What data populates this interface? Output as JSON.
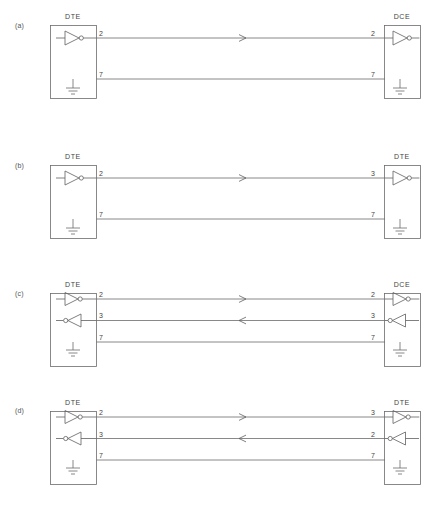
{
  "figure": {
    "line_color": "#6b6b6b",
    "text_color": "#444444",
    "background": "#ffffff"
  },
  "panels": [
    {
      "tag": "(a)",
      "left_box": {
        "label": "DTE",
        "pins": [
          "2",
          "7"
        ]
      },
      "right_box": {
        "label": "DCE",
        "pins": [
          "2",
          "7"
        ]
      },
      "links": [
        {
          "from_pin": "2",
          "to_pin": "2",
          "direction": "right",
          "kind": "data"
        },
        {
          "from_pin": "7",
          "to_pin": "7",
          "direction": "none",
          "kind": "ground"
        }
      ],
      "gates": {
        "left": [
          {
            "pin": "2",
            "role": "driver",
            "points": "right"
          }
        ],
        "right": [
          {
            "pin": "2",
            "role": "receiver",
            "points": "right"
          }
        ]
      }
    },
    {
      "tag": "(b)",
      "left_box": {
        "label": "DTE",
        "pins": [
          "2",
          "7"
        ]
      },
      "right_box": {
        "label": "DTE",
        "pins": [
          "3",
          "7"
        ]
      },
      "links": [
        {
          "from_pin": "2",
          "to_pin": "3",
          "direction": "right",
          "kind": "data"
        },
        {
          "from_pin": "7",
          "to_pin": "7",
          "direction": "none",
          "kind": "ground"
        }
      ],
      "gates": {
        "left": [
          {
            "pin": "2",
            "role": "driver",
            "points": "right"
          }
        ],
        "right": [
          {
            "pin": "3",
            "role": "receiver",
            "points": "right"
          }
        ]
      }
    },
    {
      "tag": "(c)",
      "left_box": {
        "label": "DTE",
        "pins": [
          "2",
          "3",
          "7"
        ]
      },
      "right_box": {
        "label": "DCE",
        "pins": [
          "2",
          "3",
          "7"
        ]
      },
      "links": [
        {
          "from_pin": "2",
          "to_pin": "2",
          "direction": "right",
          "kind": "data"
        },
        {
          "from_pin": "3",
          "to_pin": "3",
          "direction": "left",
          "kind": "data"
        },
        {
          "from_pin": "7",
          "to_pin": "7",
          "direction": "none",
          "kind": "ground"
        }
      ],
      "gates": {
        "left": [
          {
            "pin": "2",
            "role": "driver",
            "points": "right"
          },
          {
            "pin": "3",
            "role": "receiver",
            "points": "left"
          }
        ],
        "right": [
          {
            "pin": "2",
            "role": "receiver",
            "points": "right"
          },
          {
            "pin": "3",
            "role": "driver",
            "points": "left"
          }
        ]
      }
    },
    {
      "tag": "(d)",
      "left_box": {
        "label": "DTE",
        "pins": [
          "2",
          "3",
          "7"
        ]
      },
      "right_box": {
        "label": "DTE",
        "pins": [
          "3",
          "2",
          "7"
        ]
      },
      "links": [
        {
          "from_pin": "2",
          "to_pin": "3",
          "direction": "right",
          "kind": "data"
        },
        {
          "from_pin": "3",
          "to_pin": "2",
          "direction": "left",
          "kind": "data"
        },
        {
          "from_pin": "7",
          "to_pin": "7",
          "direction": "none",
          "kind": "ground"
        }
      ],
      "gates": {
        "left": [
          {
            "pin": "2",
            "role": "driver",
            "points": "right"
          },
          {
            "pin": "3",
            "role": "receiver",
            "points": "left"
          }
        ],
        "right": [
          {
            "pin": "3",
            "role": "receiver",
            "points": "right"
          },
          {
            "pin": "2",
            "role": "driver",
            "points": "left"
          }
        ]
      }
    }
  ]
}
